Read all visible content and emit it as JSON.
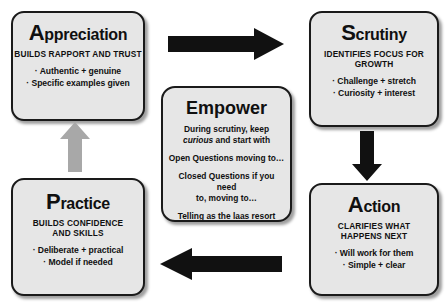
{
  "colors": {
    "box_fill": "#e6e6e6",
    "box_border": "#1a1a1a",
    "arrow_black": "#111111",
    "arrow_gray": "#a8a8a8",
    "page_background": "#ffffff",
    "text": "#101010"
  },
  "diagram": {
    "type": "cycle-diagram",
    "boxes": [
      {
        "id": "appreciation",
        "title_cap": "A",
        "title_rest": "ppreciation",
        "subtitle": "BUILDS RAPPORT AND TRUST",
        "bullets": [
          "· Authentic + genuine",
          "· Specific examples given"
        ]
      },
      {
        "id": "scrutiny",
        "title_cap": "S",
        "title_rest": "crutiny",
        "subtitle": "IDENTIFIES FOCUS FOR\nGROWTH",
        "bullets": [
          "· Challenge + stretch",
          "· Curiosity + interest"
        ]
      },
      {
        "id": "action",
        "title_cap": "A",
        "title_rest": "ction",
        "subtitle": "CLARIFIES WHAT\nHAPPENS NEXT",
        "bullets": [
          "· Will work for them",
          "· Simple + clear"
        ]
      },
      {
        "id": "practice",
        "title_cap": "P",
        "title_rest": "ractice",
        "subtitle": "BUILDS CONFIDENCE\nAND SKILLS",
        "bullets": [
          "· Deliberate + practical",
          "· Model if needed"
        ]
      }
    ],
    "center": {
      "id": "empower",
      "title": "Empower",
      "line1_a": "During scrutiny, keep",
      "line1_italic": "curious",
      "line1_b": " and start with",
      "line2": "Open Questions moving to…",
      "line3": "Closed Questions if you need\nto, moving to…",
      "line4": "Telling as the laas resort"
    },
    "arrows": [
      {
        "id": "top",
        "direction": "right",
        "color": "#111111",
        "from": "appreciation",
        "to": "scrutiny"
      },
      {
        "id": "right",
        "direction": "down",
        "color": "#111111",
        "from": "scrutiny",
        "to": "action"
      },
      {
        "id": "bottom",
        "direction": "left",
        "color": "#111111",
        "from": "action",
        "to": "practice"
      },
      {
        "id": "left",
        "direction": "up",
        "color": "#a8a8a8",
        "from": "practice",
        "to": "appreciation"
      }
    ]
  }
}
